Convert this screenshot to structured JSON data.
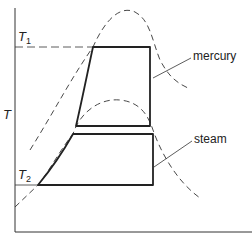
{
  "diagram": {
    "type": "temperature-entropy (T-s) diagram of binary mercury-steam vapor cycle",
    "axis": {
      "y_label": "T",
      "x_label": ""
    },
    "levels": [
      {
        "symbol": "T",
        "subscript": "1"
      },
      {
        "symbol": "T",
        "subscript": "2"
      }
    ],
    "cycles": [
      {
        "label": "mercury"
      },
      {
        "label": "steam"
      }
    ],
    "colors": {
      "line": "#222222",
      "background": "#ffffff"
    }
  }
}
